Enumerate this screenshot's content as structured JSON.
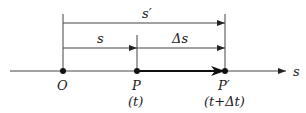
{
  "diagram": {
    "type": "displacement-on-line",
    "axis": {
      "label": "s"
    },
    "points": [
      {
        "id": "O",
        "label": "O",
        "time": ""
      },
      {
        "id": "P",
        "label": "P",
        "time": "(t)"
      },
      {
        "id": "P_prime",
        "label": "P′",
        "time": "(t+Δt)"
      }
    ],
    "brackets": {
      "s_prime": "s′",
      "s": "s",
      "delta_s": "Δs"
    },
    "colors": {
      "line": "#333333",
      "point": "#111111"
    }
  }
}
